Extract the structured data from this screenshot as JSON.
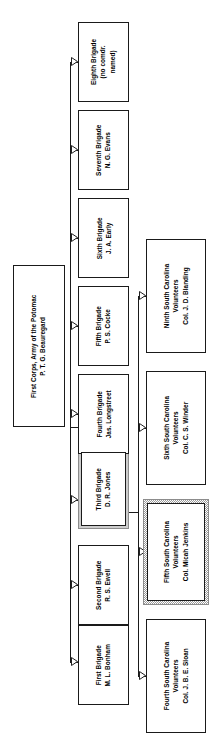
{
  "diagram": {
    "type": "organization-chart",
    "orientation": "rotated-90-text",
    "title_node": "root",
    "colors": {
      "box_border": "#1a1a1a",
      "box_fill": "#ffffff",
      "connector": "#1a1a1a",
      "highlight_frame": "#9a9a9a",
      "background": "#ffffff"
    }
  },
  "nodes": {
    "root": {
      "id": "root",
      "line1": "First Corps, Army of the Potomac",
      "line2": "P. T. G. Beauregard",
      "text": "First Corps, Army of the Potomac\nP. T. G. Beauregard",
      "highlighted": false
    },
    "brigade1": {
      "id": "first-brigade",
      "line1": "First Brigade",
      "line2": "M. L. Bonham",
      "text": "First Brigade\nM. L. Bonham",
      "highlighted": false
    },
    "brigade2": {
      "id": "second-brigade",
      "line1": "Second Brigade",
      "line2": "R. S. Ewell",
      "text": "Second Brigade\nR. S. Ewell",
      "highlighted": false
    },
    "brigade3": {
      "id": "third-brigade",
      "line1": "Third Brigade",
      "line2": "D. R. Jones",
      "text": "Third Brigade\nD. R. Jones",
      "highlighted": true
    },
    "brigade4": {
      "id": "fourth-brigade",
      "line1": "Fourth Brigade",
      "line2": "Jas. Longstreet",
      "text": "Fourth Brigade\nJas. Longstreet",
      "highlighted": false
    },
    "brigade5": {
      "id": "fifth-brigade",
      "line1": "Fifth Brigade",
      "line2": "P. S. Cocke",
      "text": "Fifth Brigade\nP. S. Cocke",
      "highlighted": false
    },
    "brigade6": {
      "id": "sixth-brigade",
      "line1": "Sixth Brigade",
      "line2": "J. A. Early",
      "text": "Sixth Brigade\nJ. A. Early",
      "highlighted": false
    },
    "brigade7": {
      "id": "seventh-brigade",
      "line1": "Seventh Brigade",
      "line2": "N. G. Evans",
      "text": "Seventh Brigade\nN. G. Evans",
      "highlighted": false
    },
    "brigade8": {
      "id": "eighth-brigade",
      "line1": "Eighth Brigade",
      "line2": "(no comdr.",
      "line3": "named)",
      "text": "Eighth Brigade\n(no comdr.\nnamed)",
      "highlighted": false
    },
    "regiment4": {
      "id": "fourth-south-carolina",
      "line1": "Fourth South Carolina",
      "line2": "Volunteers",
      "line3": "Col. J. B. E. Sloan",
      "text": "Fourth South Carolina\nVolunteers\nCol. J. B. E. Sloan",
      "highlighted": false
    },
    "regiment5": {
      "id": "fifth-south-carolina",
      "line1": "Fifth South Carolina",
      "line2": "Volunteers",
      "line3": "Col. Micah Jenkins",
      "text": "Fifth South Carolina\nVolunteers\nCol. Micah Jenkins",
      "highlighted": true
    },
    "regiment6": {
      "id": "sixth-south-carolina",
      "line1": "Sixth South Carolina",
      "line2": "Volunteers",
      "line3": "Col. C. S. Winder",
      "text": "Sixth South Carolina\nVolunteers\nCol. C. S. Winder",
      "highlighted": false
    },
    "regiment9": {
      "id": "ninth-south-carolina",
      "line1": "Ninth South Carolina",
      "line2": "Volunteers",
      "line3": "Col. J. D. Blanding",
      "text": "Ninth South Carolina\nVolunteers\nCol. J. D. Blanding",
      "highlighted": false
    }
  },
  "edges": [
    {
      "from": "root",
      "to": "brigade1"
    },
    {
      "from": "root",
      "to": "brigade2"
    },
    {
      "from": "root",
      "to": "brigade3"
    },
    {
      "from": "root",
      "to": "brigade4"
    },
    {
      "from": "root",
      "to": "brigade5"
    },
    {
      "from": "root",
      "to": "brigade6"
    },
    {
      "from": "root",
      "to": "brigade7"
    },
    {
      "from": "root",
      "to": "brigade8"
    },
    {
      "from": "brigade3",
      "to": "regiment4"
    },
    {
      "from": "brigade3",
      "to": "regiment5"
    },
    {
      "from": "brigade3",
      "to": "regiment6"
    },
    {
      "from": "brigade3",
      "to": "regiment9"
    }
  ]
}
